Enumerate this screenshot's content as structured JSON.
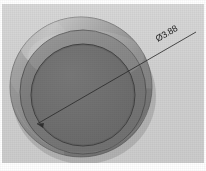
{
  "figure": {
    "background_color": "#d2d2d2",
    "paper_margin_color": "#ffffff",
    "view": "isometric-top",
    "annotation": {
      "label": "Ø3.88",
      "symbol_name": "diameter-symbol",
      "value": "3.88",
      "rotation_deg": -30,
      "leader_color": "#2b2b2b",
      "text_color": "#1c1c1c"
    },
    "geometry": {
      "outer_rim": {
        "name": "outer-rim",
        "cx": 81,
        "cy": 87,
        "rx": 71,
        "ry": 70,
        "fill": "#8f8f8f"
      },
      "mid_ring": {
        "name": "mid-ring",
        "cx": 83,
        "cy": 92,
        "rx": 63,
        "ry": 62,
        "fill": "#777777"
      },
      "inner_face": {
        "name": "inner-face",
        "cx": 83,
        "cy": 95,
        "rx": 52,
        "ry": 51,
        "fill": "#6e6e6e"
      },
      "dimension_line": {
        "name": "diameter-dimension-line",
        "x1": 37,
        "y1": 124,
        "x2": 196,
        "y2": 32
      }
    },
    "colors": {
      "background": "#d2d2d2",
      "rim_light": "#a5a5a5",
      "rim_dark": "#777777",
      "face": "#6e6e6e",
      "outline": "#3a3a3a",
      "leader": "#2b2b2b"
    }
  }
}
